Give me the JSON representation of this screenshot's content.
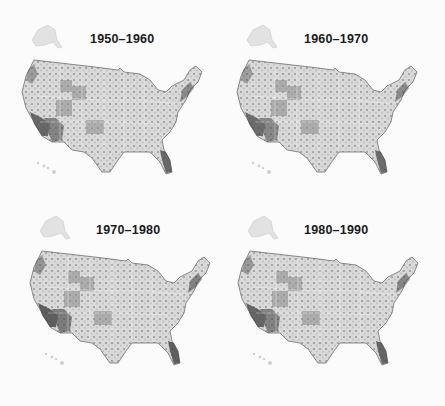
{
  "figure": {
    "panels": [
      {
        "title": "1950–1960",
        "intensity": 0.55
      },
      {
        "title": "1960–1970",
        "intensity": 0.5
      },
      {
        "title": "1970–1980",
        "intensity": 0.7
      },
      {
        "title": "1980–1990",
        "intensity": 0.6
      }
    ],
    "colors": {
      "background": "#fbfbfb",
      "light": "#e6e6e6",
      "mid": "#b5b5b5",
      "dark": "#4a4a4a",
      "title": "#1a1a1a"
    }
  }
}
